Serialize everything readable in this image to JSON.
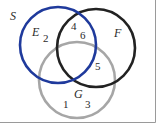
{
  "diagram": {
    "type": "venn",
    "universe_label": "S",
    "sets": [
      {
        "id": "E",
        "label": "E",
        "color": "#1f3a9c",
        "cx": 58,
        "cy": 45,
        "r": 38
      },
      {
        "id": "F",
        "label": "F",
        "color": "#222222",
        "cx": 96,
        "cy": 48,
        "r": 39
      },
      {
        "id": "G",
        "label": "G",
        "color": "#a6a6a6",
        "cx": 77,
        "cy": 80,
        "r": 38
      }
    ],
    "elements": [
      {
        "value": "2",
        "region": "E only"
      },
      {
        "value": "4",
        "region": "E ∩ F"
      },
      {
        "value": "6",
        "region": "E ∩ F"
      },
      {
        "value": "5",
        "region": "F ∩ G"
      },
      {
        "value": "1",
        "region": "G only"
      },
      {
        "value": "3",
        "region": "G only"
      }
    ],
    "border_color": "#9a9a9a"
  }
}
